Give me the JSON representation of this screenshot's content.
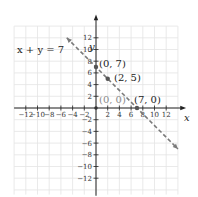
{
  "chart_data": {
    "type": "line",
    "title": "",
    "equation_label": "x + y = 7",
    "xlabel": "x",
    "ylabel": "y",
    "xlim": [
      -14,
      14
    ],
    "ylim": [
      -14,
      14
    ],
    "grid": true,
    "x_ticks": [
      -12,
      -10,
      -8,
      -6,
      -4,
      -2,
      2,
      4,
      6,
      8,
      10,
      12
    ],
    "y_ticks": [
      -12,
      -10,
      -8,
      -6,
      -4,
      -2,
      2,
      4,
      6,
      8,
      10,
      12
    ],
    "x_tick_labels": [
      "−12",
      "−10",
      "−8",
      "−6",
      "−4",
      "−2",
      "2",
      "4",
      "6",
      "8",
      "10",
      "12"
    ],
    "y_tick_labels": [
      "−12",
      "−10",
      "−8",
      "−6",
      "−4",
      "−2",
      "2",
      "4",
      "6",
      "8",
      "10",
      "12"
    ],
    "series": [
      {
        "name": "x + y = 7",
        "style": "dashed",
        "color": "#7a7a7a",
        "x": [
          -5,
          14
        ],
        "y": [
          12,
          -7
        ],
        "arrows": "both"
      }
    ],
    "points": [
      {
        "label": "(0, 7)",
        "x": 0,
        "y": 7,
        "marked": true
      },
      {
        "label": "(2, 5)",
        "x": 2,
        "y": 5,
        "marked": true
      },
      {
        "label": "(7, 0)",
        "x": 7,
        "y": 0,
        "marked": true
      },
      {
        "label": "(0, 0)",
        "x": 0,
        "y": 0,
        "marked": true,
        "muted": true
      }
    ]
  },
  "labels": {
    "equation": "x + y = 7",
    "x_axis": "x",
    "y_axis": "y",
    "p07": "(0, 7)",
    "p25": "(2, 5)",
    "p70": "(7, 0)",
    "p00": "(0, 0)"
  }
}
